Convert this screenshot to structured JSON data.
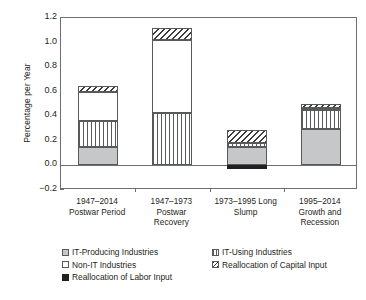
{
  "chart_data": {
    "type": "bar",
    "subtype": "stacked-bar",
    "title": "",
    "xlabel": "",
    "ylabel": "Percentage per Year",
    "ylim": [
      -0.2,
      1.2
    ],
    "ytick_values": [
      -0.2,
      0.0,
      0.2,
      0.4,
      0.6,
      0.8,
      1.0,
      1.2
    ],
    "ytick_labels": [
      "−0.2",
      "0.0",
      "0.2",
      "0.4",
      "0.6",
      "0.8",
      "1.0",
      "1.2"
    ],
    "grid": false,
    "legend_position": "bottom-left",
    "categories": [
      "1947–2014 Postwar Period",
      "1947–1973 Postwar Recovery",
      "1973–1995 Long Slump",
      "1995–2014 Growth and Recession"
    ],
    "category_lines": [
      [
        "1947–2014",
        "Postwar Period"
      ],
      [
        "1947–1973",
        "Postwar",
        "Recovery"
      ],
      [
        "1973–1995 Long",
        "Slump"
      ],
      [
        "1995–2014",
        "Growth and",
        "Recession"
      ]
    ],
    "series": [
      {
        "name": "IT-Producing Industries",
        "pattern": "gray",
        "values": [
          0.15,
          0.0,
          0.15,
          0.3
        ]
      },
      {
        "name": "IT-Using Industries",
        "pattern": "vlines",
        "values": [
          0.21,
          0.43,
          0.03,
          0.15
        ]
      },
      {
        "name": "Non-IT Industries",
        "pattern": "white",
        "values": [
          0.24,
          0.59,
          0.0,
          0.02
        ]
      },
      {
        "name": "Reallocation of Capital Input",
        "pattern": "hatch",
        "values": [
          0.05,
          0.1,
          0.11,
          0.03
        ]
      },
      {
        "name": "Reallocation of Labor Input",
        "pattern": "black",
        "values": [
          0.0,
          0.0,
          -0.03,
          0.0
        ]
      }
    ],
    "totals": [
      0.65,
      1.12,
      0.29,
      0.5
    ]
  },
  "legend": {
    "items": [
      {
        "label": "IT-Producing Industries",
        "pattern": "gray"
      },
      {
        "label": "IT-Using Industries",
        "pattern": "vlines"
      },
      {
        "label": "Non-IT Industries",
        "pattern": "white"
      },
      {
        "label": "Reallocation of Capital Input",
        "pattern": "hatch"
      },
      {
        "label": "Reallocation of Labor Input",
        "pattern": "black"
      }
    ]
  },
  "colors": {
    "axis": "#6d6e71",
    "text": "#231f20",
    "gray_fill": "#c6c7c9",
    "black_fill": "#231f20",
    "background": "#ffffff"
  }
}
